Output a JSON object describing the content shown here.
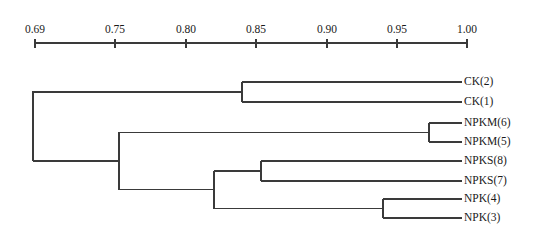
{
  "figure": {
    "type": "dendrogram",
    "background_color": "#ffffff",
    "line_color": "#3a3a3a",
    "text_color": "#1a1a1a"
  },
  "axis": {
    "orientation": "top",
    "min": 0.69,
    "max": 1.0,
    "pixel_min_x": 35,
    "pixel_max_x": 467,
    "pixel_y": 43,
    "tick_labels": [
      "0.69",
      "0.75",
      "0.80",
      "0.85",
      "0.90",
      "0.95",
      "1.00"
    ],
    "tick_values": [
      0.69,
      0.75,
      0.8,
      0.85,
      0.9,
      0.95,
      1.0
    ],
    "tick_pixels": [
      35,
      115,
      186,
      256,
      327,
      397,
      467
    ]
  },
  "chart_data": {
    "type": "dendrogram",
    "title": "",
    "xlabel": "",
    "ylabel": "",
    "xlim": [
      0.69,
      1.0
    ],
    "grid": false,
    "legend": null,
    "orientation": "horizontal-right-leaves",
    "similarity_axis": true,
    "leaves": [
      {
        "label": "CK(2)",
        "y": 82,
        "x_start": 242,
        "x_end": 462
      },
      {
        "label": "CK(1)",
        "y": 102,
        "x_start": 242,
        "x_end": 462
      },
      {
        "label": "NPKM(6)",
        "y": 123,
        "x_start": 429,
        "x_end": 462
      },
      {
        "label": "NPKM(5)",
        "y": 142,
        "x_start": 429,
        "x_end": 462
      },
      {
        "label": "NPKS(8)",
        "y": 161,
        "x_start": 261,
        "x_end": 462
      },
      {
        "label": "NPKS(7)",
        "y": 181,
        "x_start": 261,
        "x_end": 462
      },
      {
        "label": "NPK(4)",
        "y": 199,
        "x_start": 383,
        "x_end": 462
      },
      {
        "label": "NPK(3)",
        "y": 218,
        "x_start": 383,
        "x_end": 462
      }
    ],
    "merges": [
      {
        "name": "ck-pair",
        "members": [
          "CK(2)",
          "CK(1)"
        ],
        "similarity": 0.838,
        "x": 242,
        "y_top": 82,
        "y_bottom": 102,
        "parent_x": 33
      },
      {
        "name": "npkm-pair",
        "members": [
          "NPKM(6)",
          "NPKM(5)"
        ],
        "similarity": 0.972,
        "x": 429,
        "y_top": 123,
        "y_bottom": 142,
        "parent_x": 119
      },
      {
        "name": "npks-pair",
        "members": [
          "NPKS(8)",
          "NPKS(7)"
        ],
        "similarity": 0.852,
        "x": 261,
        "y_top": 161,
        "y_bottom": 181,
        "parent_x": 214
      },
      {
        "name": "npk-pair",
        "members": [
          "NPK(4)",
          "NPK(3)"
        ],
        "similarity": 0.94,
        "x": 383,
        "y_top": 199,
        "y_bottom": 218,
        "parent_x": 214
      },
      {
        "name": "npks-npk-node",
        "members": [
          "npks-pair",
          "npk-pair"
        ],
        "similarity": 0.818,
        "x": 214,
        "y_top": 171,
        "y_bottom": 208.5,
        "parent_x": 119
      },
      {
        "name": "fertilizer-node",
        "members": [
          "npkm-pair",
          "npks-npk-node"
        ],
        "similarity": 0.75,
        "x": 119,
        "y_top": 132,
        "y_bottom": 190,
        "parent_x": 33
      },
      {
        "name": "root-node",
        "members": [
          "ck-pair",
          "fertilizer-node"
        ],
        "similarity": 0.688,
        "x": 33,
        "y_top": 91,
        "y_bottom": 161,
        "parent_x": null
      }
    ]
  }
}
